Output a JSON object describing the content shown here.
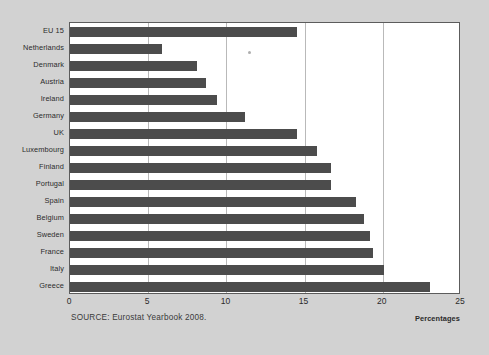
{
  "chart_data": {
    "type": "bar",
    "orientation": "horizontal",
    "title": "",
    "subtitle": "",
    "xlabel": "Percentages",
    "ylabel": "",
    "xlim": [
      0,
      25
    ],
    "ylim": null,
    "grid": true,
    "legend": null,
    "xticks": [
      0,
      5,
      10,
      15,
      20,
      25
    ],
    "xtick_labels": [
      "0",
      "5",
      "10",
      "15",
      "20",
      "25"
    ],
    "categories": [
      "EU 15",
      "Netherlands",
      "Denmark",
      "Austria",
      "Ireland",
      "Germany",
      "UK",
      "Luxembourg",
      "Finland",
      "Portugal",
      "Spain",
      "Belgium",
      "Sweden",
      "France",
      "Italy",
      "Greece"
    ],
    "values": [
      14.5,
      5.9,
      8.1,
      8.7,
      9.4,
      11.2,
      14.5,
      15.8,
      16.7,
      16.7,
      18.3,
      18.8,
      19.2,
      19.4,
      20.1,
      23.0
    ],
    "series": [
      {
        "name": "Percentages",
        "color": "#4c4c4c",
        "values": [
          14.5,
          5.9,
          8.1,
          8.7,
          9.4,
          11.2,
          14.5,
          15.8,
          16.7,
          16.7,
          18.3,
          18.8,
          19.2,
          19.4,
          20.1,
          23.0
        ]
      }
    ],
    "annotations": [
      "SOURCE: Eurostat Yearbook 2008."
    ],
    "colors": {
      "bar": "#4c4c4c",
      "plot_background": "#ffffff",
      "page_background": "#d2d2d2",
      "gridline": "#b9b9b9",
      "axis": "#5c5c5c",
      "text": "#2b2b2b"
    }
  },
  "source_note": "SOURCE: Eurostat Yearbook 2008.",
  "axis_unit_label": "Percentages"
}
